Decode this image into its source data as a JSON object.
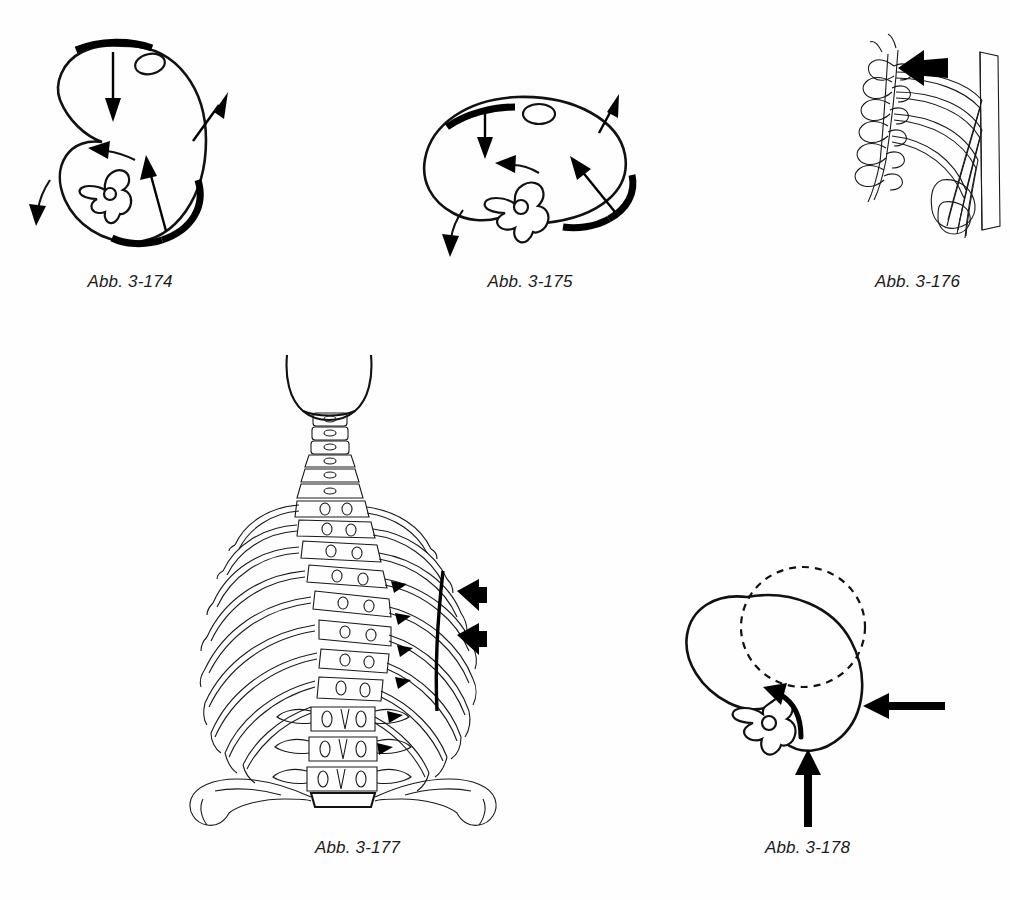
{
  "page": {
    "background_color": "#ffffff",
    "ink_color": "#111111",
    "kind": "anatomical-illustration-plate",
    "language": "de"
  },
  "figures": [
    {
      "id": "fig-174",
      "caption": "Abb. 3-174",
      "icon_name": "thorax-cross-section-inhalation-diagram",
      "description": "Transverse cross-section of upper thorax with vertebra, showing directional force arrows and two thick black rib segments",
      "arrows": [
        {
          "name": "arrow-down-top",
          "direction": "down"
        },
        {
          "name": "arrow-up-right-outer",
          "direction": "up-right"
        },
        {
          "name": "arrow-left-curved",
          "direction": "left"
        },
        {
          "name": "arrow-up-inner",
          "direction": "up"
        },
        {
          "name": "arrow-down-curved-left",
          "direction": "down"
        }
      ],
      "thick_marks": 2
    },
    {
      "id": "fig-175",
      "caption": "Abb. 3-175",
      "icon_name": "thorax-cross-section-flattened-diagram",
      "description": "Flattened transverse cross-section of thorax with vertebra, force arrows and two thick black rib segments",
      "arrows": [
        {
          "name": "arrow-down-top",
          "direction": "down"
        },
        {
          "name": "arrow-up-right-outer",
          "direction": "up-right"
        },
        {
          "name": "arrow-left-curved",
          "direction": "left"
        },
        {
          "name": "arrow-up-left-inner",
          "direction": "up-left"
        },
        {
          "name": "arrow-down-curved-left",
          "direction": "down"
        }
      ],
      "thick_marks": 2
    },
    {
      "id": "fig-176",
      "caption": "Abb. 3-176",
      "icon_name": "thoracic-spine-ribs-lateral-diagram",
      "description": "Lateral oblique view of thoracic vertebrae with attached ribs and sternum, bold solid arrow indicating movement direction",
      "arrows": [
        {
          "name": "arrow-bold-upper-left",
          "direction": "left"
        }
      ],
      "thick_marks": 0
    },
    {
      "id": "fig-177",
      "caption": "Abb. 3-177",
      "icon_name": "posterior-thorax-spine-ribcage-diagram",
      "description": "Posterior view of full rib cage, cervical, thoracic and lumbar spine, sacrum and iliac crests, with rib-angle arrowheads, a vertical reference line and two bold left-pointing arrows",
      "arrows": [
        {
          "name": "arrow-bold-upper",
          "direction": "left"
        },
        {
          "name": "arrow-bold-lower",
          "direction": "left"
        }
      ],
      "rib_arrowheads": 6,
      "reference_line": true
    },
    {
      "id": "fig-178",
      "caption": "Abb. 3-178",
      "icon_name": "thorax-rotation-cross-section-diagram",
      "description": "Transverse cross-section of thorax with vertebra, dashed outline showing original position and solid outline showing rotated position, with bold straight and curved arrows",
      "arrows": [
        {
          "name": "arrow-bold-left-lateral",
          "direction": "left"
        },
        {
          "name": "arrow-bold-up-inferior",
          "direction": "up"
        },
        {
          "name": "arrow-curved-rotation",
          "direction": "up-left"
        }
      ],
      "dashed_outline": true
    }
  ]
}
